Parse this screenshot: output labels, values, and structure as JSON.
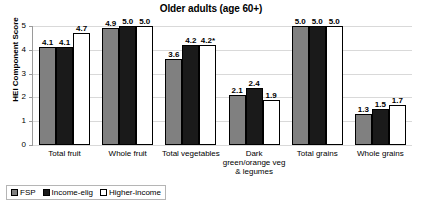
{
  "chart_data": {
    "type": "bar",
    "title": "Older adults (age 60+)",
    "xlabel": "",
    "ylabel": "HEI Component Score",
    "ylim": [
      0,
      5
    ],
    "yticks": [
      "0",
      "1",
      "2",
      "3",
      "4",
      "5"
    ],
    "grid": true,
    "legend_position": "bottom-left",
    "categories": [
      "Total fruit",
      "Whole fruit",
      "Total vegetables",
      "Dark green/orange veg & legumes",
      "Total grains",
      "Whole grains"
    ],
    "series": [
      {
        "name": "FSP",
        "color": "#808080",
        "values": [
          4.1,
          4.9,
          3.6,
          2.1,
          5.0,
          1.3
        ],
        "labels": [
          "4.1",
          "4.9",
          "3.6",
          "2.1",
          "5.0",
          "1.3"
        ]
      },
      {
        "name": "Income-elig",
        "color": "#1a1a1a",
        "values": [
          4.1,
          5.0,
          4.2,
          2.4,
          5.0,
          1.5
        ],
        "labels": [
          "4.1",
          "5.0",
          "4.2",
          "2.4",
          "5.0",
          "1.5"
        ]
      },
      {
        "name": "Higher-income",
        "color": "#ffffff",
        "values": [
          4.7,
          5.0,
          4.2,
          1.9,
          5.0,
          1.7
        ],
        "labels": [
          "4.7",
          "5.0",
          "4.2*",
          "1.9",
          "5.0",
          "1.7"
        ]
      }
    ]
  },
  "category_lines": [
    [
      "Total fruit"
    ],
    [
      "Whole fruit"
    ],
    [
      "Total vegetables"
    ],
    [
      "Dark",
      "green/orange veg",
      "& legumes"
    ],
    [
      "Total grains"
    ],
    [
      "Whole grains"
    ]
  ]
}
